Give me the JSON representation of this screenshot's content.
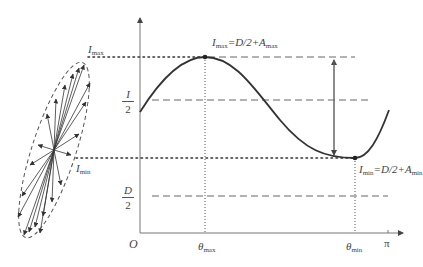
{
  "diagram": {
    "type": "polarization-intensity-plot",
    "axes": {
      "origin_label": "O",
      "x_end_label": "π",
      "x_ticks": [
        {
          "id": "theta_max",
          "symbol": "θ",
          "sub": "max"
        },
        {
          "id": "theta_min",
          "symbol": "θ",
          "sub": "min"
        }
      ],
      "y_ticks": [
        {
          "id": "I_max",
          "symbol": "I",
          "sub": "max"
        },
        {
          "id": "I_half",
          "num": "I",
          "den": "2"
        },
        {
          "id": "I_min",
          "symbol": "I",
          "sub": "min"
        },
        {
          "id": "D_half",
          "num": "D",
          "den": "2"
        }
      ]
    },
    "annotations": {
      "max_eq": {
        "lhs": "I",
        "lhs_sub": "max",
        "rhs": "=D/2+A",
        "rhs_sub": "max"
      },
      "min_eq": {
        "lhs": "I",
        "lhs_sub": "min",
        "rhs": "=D/2+A",
        "rhs_sub": "min"
      }
    },
    "ellipse": {
      "description": "dashed ellipse with radiating arrows (polarization vectors)",
      "label_max": {
        "symbol": "I",
        "sub": "max"
      },
      "label_min": {
        "symbol": "I",
        "sub": "min"
      }
    },
    "colors": {
      "line": "#555555",
      "curve": "#333333",
      "guide": "#666666"
    }
  }
}
